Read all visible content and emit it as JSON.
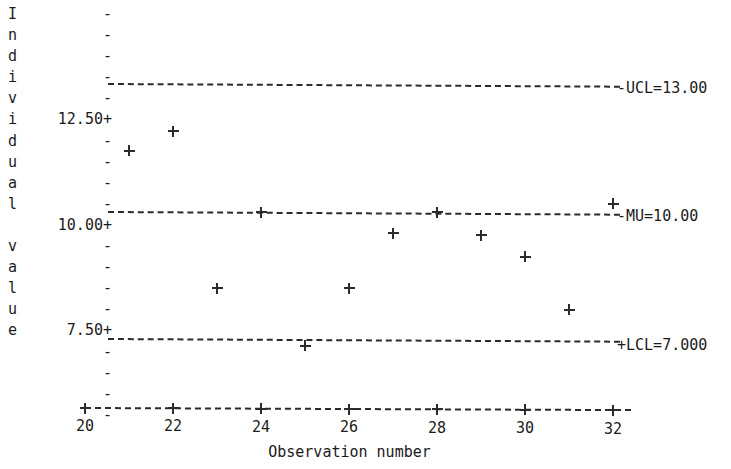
{
  "chart_data": {
    "type": "scatter",
    "title": "",
    "xlabel": "Observation number",
    "ylabel": "Individual value",
    "ylabel_chars": [
      "I",
      "n",
      "d",
      "i",
      "v",
      "i",
      "d",
      "u",
      "a",
      "l",
      "",
      "v",
      "a",
      "l",
      "u",
      "e"
    ],
    "x": [
      21,
      22,
      23,
      24,
      25,
      26,
      27,
      28,
      29,
      30,
      31,
      32
    ],
    "values": [
      11.45,
      11.9,
      8.2,
      10.0,
      6.85,
      8.2,
      9.5,
      10.0,
      9.45,
      8.95,
      7.7,
      10.2
    ],
    "xlim": [
      19.5,
      32.6
    ],
    "ylim": [
      5.85,
      13.6
    ],
    "xticks": [
      20,
      22,
      24,
      26,
      28,
      30,
      32
    ],
    "yticks": [
      12.5,
      10.0,
      7.5
    ],
    "ytick_labels": [
      "12.50+",
      "10.00+",
      "7.50+"
    ],
    "minor_ytick_glyph": "-",
    "tick_glyph": "+",
    "marker": "+",
    "grid": false,
    "legend": "none",
    "line_style": "dashed",
    "control_lines": [
      {
        "name": "UCL",
        "label": "-UCL=13.00",
        "value": 13.0
      },
      {
        "name": "MU",
        "label": "-MU=10.00",
        "value": 10.0
      },
      {
        "name": "LCL",
        "label": "+LCL=7.000",
        "value": 7.0
      }
    ]
  },
  "colors": {
    "background": "#ffffff",
    "ink": "#1b1b1b",
    "line": "#2b2b2b"
  }
}
